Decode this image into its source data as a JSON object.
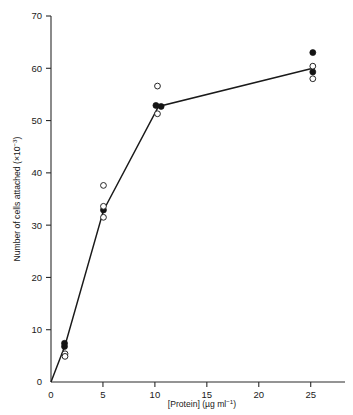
{
  "figure": {
    "background": "#ffffff",
    "ink": "#1a1a1a"
  },
  "chart_data": {
    "type": "scatter",
    "title": "",
    "xlabel": "[Protein] (µg ml⁻¹)",
    "xlabel_parts": {
      "main": "[Protein] (",
      "unit": "µg ml",
      "exponent": "−1",
      "close": ")"
    },
    "ylabel": "Number of cells attached (×10⁻³)",
    "ylabel_parts": {
      "main": "Number of cells attached (×10",
      "exponent": "−3",
      "close": ")"
    },
    "xlim": [
      0,
      28.3
    ],
    "ylim": [
      0,
      70
    ],
    "xticks": [
      0,
      5,
      10,
      15,
      20,
      25
    ],
    "xtick_labels": [
      "0",
      "5",
      "10",
      "15",
      "20",
      "25"
    ],
    "yticks": [
      0,
      10,
      20,
      30,
      40,
      50,
      60,
      70
    ],
    "ytick_labels": [
      "0",
      "10",
      "20",
      "30",
      "40",
      "50",
      "60",
      "70"
    ],
    "grid": false,
    "legend": "none",
    "legend_position": "none",
    "fit_line": {
      "name": "mean response curve",
      "points": [
        {
          "x": 0.0,
          "y": 0.0
        },
        {
          "x": 1.35,
          "y": 7.0
        },
        {
          "x": 5.05,
          "y": 32.8
        },
        {
          "x": 10.35,
          "y": 52.7
        },
        {
          "x": 25.2,
          "y": 60.0
        }
      ]
    },
    "series": [
      {
        "name": "filled circles",
        "marker": "filled-circle",
        "color": "#141414",
        "points": [
          {
            "x": 1.3,
            "y": 7.4
          },
          {
            "x": 1.3,
            "y": 6.8
          },
          {
            "x": 5.05,
            "y": 32.9
          },
          {
            "x": 10.1,
            "y": 52.9
          },
          {
            "x": 10.6,
            "y": 52.7
          },
          {
            "x": 25.2,
            "y": 63.0
          },
          {
            "x": 25.2,
            "y": 59.3
          }
        ]
      },
      {
        "name": "open circles",
        "marker": "open-circle",
        "color": "#ffffff",
        "points": [
          {
            "x": 1.35,
            "y": 5.4
          },
          {
            "x": 1.35,
            "y": 4.9
          },
          {
            "x": 5.05,
            "y": 37.6
          },
          {
            "x": 5.05,
            "y": 33.6
          },
          {
            "x": 5.05,
            "y": 31.5
          },
          {
            "x": 10.25,
            "y": 56.6
          },
          {
            "x": 10.25,
            "y": 51.3
          },
          {
            "x": 25.2,
            "y": 60.4
          },
          {
            "x": 25.2,
            "y": 58.0
          }
        ]
      }
    ]
  }
}
